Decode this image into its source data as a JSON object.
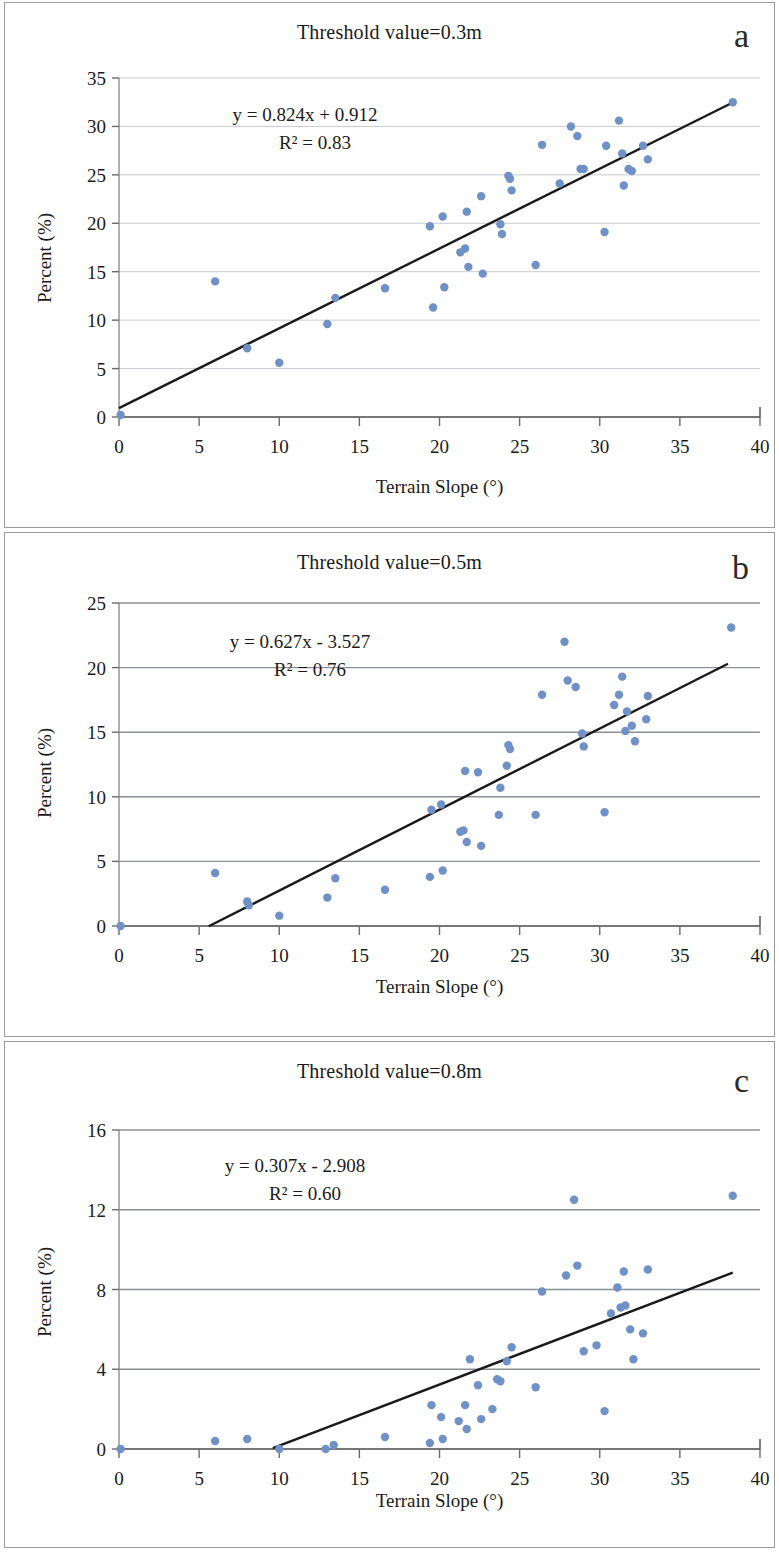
{
  "figure": {
    "xlabel": "Terrain Slope (°)",
    "ylabel": "Percent (%)",
    "marker_color": "#6f91c6",
    "trend_color": "#1a1a1a"
  },
  "panels": [
    {
      "letter": "a",
      "title": "Threshold value=0.3m",
      "equation": "y = 0.824x + 0.912",
      "r2": "R² = 0.83"
    },
    {
      "letter": "b",
      "title": "Threshold value=0.5m",
      "equation": "y = 0.627x - 3.527",
      "r2": "R² = 0.76"
    },
    {
      "letter": "c",
      "title": "Threshold value=0.8m",
      "equation": "y = 0.307x - 2.908",
      "r2": "R² = 0.60"
    }
  ],
  "chart_data": [
    {
      "type": "scatter",
      "panel": "a",
      "title": "Threshold value=0.3m",
      "xlabel": "Terrain Slope (°)",
      "ylabel": "Percent (%)",
      "xlim": [
        0,
        40
      ],
      "ylim": [
        0,
        35
      ],
      "xticks": [
        0,
        5,
        10,
        15,
        20,
        25,
        30,
        35,
        40
      ],
      "yticks": [
        0,
        5,
        10,
        15,
        20,
        25,
        30,
        35
      ],
      "grid": "horizontal",
      "legend": "none",
      "annotations": [
        "y = 0.824x + 0.912",
        "R² = 0.83"
      ],
      "fit": {
        "slope": 0.824,
        "intercept": 0.912,
        "r2": 0.83,
        "x_start": 0,
        "x_end": 38.3
      },
      "points": [
        [
          0.1,
          0.2
        ],
        [
          6.0,
          14.0
        ],
        [
          8.0,
          7.1
        ],
        [
          10.0,
          5.6
        ],
        [
          13.0,
          9.6
        ],
        [
          13.5,
          12.3
        ],
        [
          16.6,
          13.3
        ],
        [
          19.4,
          19.7
        ],
        [
          19.6,
          11.3
        ],
        [
          20.2,
          20.7
        ],
        [
          20.3,
          13.4
        ],
        [
          21.3,
          17.0
        ],
        [
          21.6,
          17.4
        ],
        [
          21.7,
          21.2
        ],
        [
          21.8,
          15.5
        ],
        [
          22.6,
          22.8
        ],
        [
          22.7,
          14.8
        ],
        [
          23.8,
          19.9
        ],
        [
          23.9,
          18.9
        ],
        [
          24.3,
          24.9
        ],
        [
          24.4,
          24.6
        ],
        [
          24.5,
          23.4
        ],
        [
          26.0,
          15.7
        ],
        [
          26.4,
          28.1
        ],
        [
          27.5,
          24.1
        ],
        [
          28.2,
          30.0
        ],
        [
          28.6,
          29.0
        ],
        [
          28.8,
          25.6
        ],
        [
          29.0,
          25.6
        ],
        [
          30.3,
          19.1
        ],
        [
          30.4,
          28.0
        ],
        [
          31.2,
          30.6
        ],
        [
          31.4,
          27.2
        ],
        [
          31.5,
          23.9
        ],
        [
          31.8,
          25.6
        ],
        [
          32.0,
          25.4
        ],
        [
          32.7,
          28.0
        ],
        [
          33.0,
          26.6
        ],
        [
          38.3,
          32.5
        ]
      ]
    },
    {
      "type": "scatter",
      "panel": "b",
      "title": "Threshold value=0.5m",
      "xlabel": "Terrain Slope (°)",
      "ylabel": "Percent (%)",
      "xlim": [
        0,
        40
      ],
      "ylim": [
        0,
        25
      ],
      "xticks": [
        0,
        5,
        10,
        15,
        20,
        25,
        30,
        35,
        40
      ],
      "yticks": [
        0,
        5,
        10,
        15,
        20,
        25
      ],
      "grid": "horizontal",
      "legend": "none",
      "annotations": [
        "y = 0.627x - 3.527",
        "R² = 0.76"
      ],
      "fit": {
        "slope": 0.627,
        "intercept": -3.527,
        "r2": 0.76,
        "x_start": 5.6,
        "x_end": 38.0
      },
      "points": [
        [
          0.1,
          0.0
        ],
        [
          6.0,
          4.1
        ],
        [
          8.0,
          1.9
        ],
        [
          8.1,
          1.6
        ],
        [
          10.0,
          0.8
        ],
        [
          13.0,
          2.2
        ],
        [
          13.5,
          3.7
        ],
        [
          16.6,
          2.8
        ],
        [
          19.4,
          3.8
        ],
        [
          19.5,
          9.0
        ],
        [
          20.1,
          9.4
        ],
        [
          20.2,
          4.3
        ],
        [
          21.3,
          7.3
        ],
        [
          21.5,
          7.4
        ],
        [
          21.6,
          12.0
        ],
        [
          21.7,
          6.5
        ],
        [
          22.4,
          11.9
        ],
        [
          22.6,
          6.2
        ],
        [
          23.7,
          8.6
        ],
        [
          23.8,
          10.7
        ],
        [
          24.2,
          12.4
        ],
        [
          24.3,
          14.0
        ],
        [
          24.4,
          13.7
        ],
        [
          26.0,
          8.6
        ],
        [
          26.4,
          17.9
        ],
        [
          27.8,
          22.0
        ],
        [
          28.0,
          19.0
        ],
        [
          28.5,
          18.5
        ],
        [
          28.9,
          14.9
        ],
        [
          29.0,
          13.9
        ],
        [
          30.3,
          8.8
        ],
        [
          30.9,
          17.1
        ],
        [
          31.2,
          17.9
        ],
        [
          31.4,
          19.3
        ],
        [
          31.6,
          15.1
        ],
        [
          31.7,
          16.6
        ],
        [
          32.0,
          15.5
        ],
        [
          32.2,
          14.3
        ],
        [
          32.9,
          16.0
        ],
        [
          33.0,
          17.8
        ],
        [
          38.2,
          23.1
        ]
      ]
    },
    {
      "type": "scatter",
      "panel": "c",
      "title": "Threshold value=0.8m",
      "xlabel": "Terrain Slope (°)",
      "ylabel": "Percent (%)",
      "xlim": [
        0,
        40
      ],
      "ylim": [
        0,
        16
      ],
      "xticks": [
        0,
        5,
        10,
        15,
        20,
        25,
        30,
        35,
        40
      ],
      "yticks": [
        0,
        4,
        8,
        12,
        16
      ],
      "grid": "horizontal",
      "legend": "none",
      "annotations": [
        "y = 0.307x - 2.908",
        "R² = 0.60"
      ],
      "fit": {
        "slope": 0.307,
        "intercept": -2.908,
        "r2": 0.6,
        "x_start": 9.6,
        "x_end": 38.3
      },
      "points": [
        [
          0.1,
          0.0
        ],
        [
          6.0,
          0.4
        ],
        [
          8.0,
          0.5
        ],
        [
          10.0,
          0.0
        ],
        [
          12.9,
          0.0
        ],
        [
          13.4,
          0.2
        ],
        [
          16.6,
          0.6
        ],
        [
          19.4,
          0.3
        ],
        [
          19.5,
          2.2
        ],
        [
          20.1,
          1.6
        ],
        [
          20.2,
          0.5
        ],
        [
          21.2,
          1.4
        ],
        [
          21.6,
          2.2
        ],
        [
          21.7,
          1.0
        ],
        [
          21.9,
          4.5
        ],
        [
          22.4,
          3.2
        ],
        [
          22.6,
          1.5
        ],
        [
          23.3,
          2.0
        ],
        [
          23.6,
          3.5
        ],
        [
          23.8,
          3.4
        ],
        [
          24.2,
          4.4
        ],
        [
          24.5,
          5.1
        ],
        [
          26.0,
          3.1
        ],
        [
          26.4,
          7.9
        ],
        [
          27.9,
          8.7
        ],
        [
          28.4,
          12.5
        ],
        [
          28.6,
          9.2
        ],
        [
          29.0,
          4.9
        ],
        [
          29.8,
          5.2
        ],
        [
          30.3,
          1.9
        ],
        [
          30.7,
          6.8
        ],
        [
          31.1,
          8.1
        ],
        [
          31.3,
          7.1
        ],
        [
          31.5,
          8.9
        ],
        [
          31.6,
          7.2
        ],
        [
          31.9,
          6.0
        ],
        [
          32.1,
          4.5
        ],
        [
          32.7,
          5.8
        ],
        [
          33.0,
          9.0
        ],
        [
          38.3,
          12.7
        ]
      ]
    }
  ]
}
